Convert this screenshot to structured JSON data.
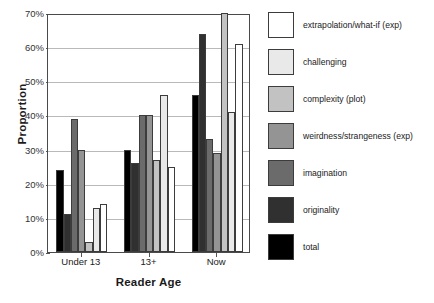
{
  "chart_data": {
    "type": "bar",
    "title": "",
    "xlabel": "Reader Age",
    "ylabel": "Proportion",
    "categories": [
      "Under 13",
      "13+",
      "Now"
    ],
    "ylim": [
      0,
      70
    ],
    "ytick_labels": [
      "0%",
      "10%",
      "20%",
      "30%",
      "40%",
      "50%",
      "60%",
      "70%"
    ],
    "ytick_values": [
      0,
      10,
      20,
      30,
      40,
      50,
      60,
      70
    ],
    "grid": true,
    "legend_position": "right",
    "series": [
      {
        "name": "extrapolation/what-if (exp)",
        "color": "#ffffff",
        "values": [
          14,
          25,
          61
        ]
      },
      {
        "name": "challenging",
        "color": "#e9e9e9",
        "values": [
          13,
          46,
          41
        ]
      },
      {
        "name": "complexity (plot)",
        "color": "#c2c2c2",
        "values": [
          3,
          27,
          70
        ]
      },
      {
        "name": "weirdness/strangeness (exp)",
        "color": "#949494",
        "values": [
          30,
          40,
          29
        ]
      },
      {
        "name": "imagination",
        "color": "#6b6b6b",
        "values": [
          39,
          40,
          33
        ]
      },
      {
        "name": "originality",
        "color": "#303030",
        "values": [
          11,
          26,
          64
        ]
      },
      {
        "name": "total",
        "color": "#000000",
        "values": [
          24,
          30,
          46
        ]
      }
    ],
    "bar_order_in_group": [
      "total",
      "originality",
      "imagination",
      "weirdness/strangeness (exp)",
      "complexity (plot)",
      "challenging",
      "extrapolation/what-if (exp)"
    ]
  }
}
